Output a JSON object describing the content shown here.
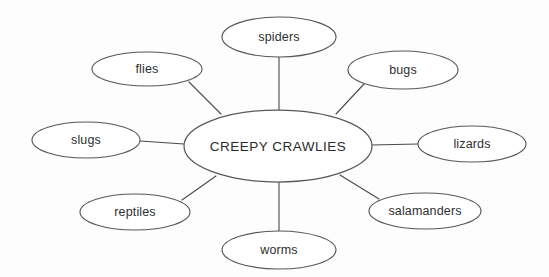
{
  "diagram": {
    "type": "spider-map",
    "background_color": "#fdfdfd",
    "line_color": "#4a4a4a",
    "node_stroke_color": "#55585c",
    "node_fill_color": "#ffffff",
    "text_color": "#2f2f2f",
    "center": {
      "label": "CREEPY CRAWLIES",
      "cx": 278,
      "cy": 146,
      "rx": 94,
      "ry": 36
    },
    "nodes": [
      {
        "id": "spiders",
        "label": "spiders",
        "cx": 279,
        "cy": 37,
        "rx": 57,
        "ry": 20,
        "connector": {
          "x1": 279,
          "y1": 57,
          "x2": 279,
          "y2": 110
        }
      },
      {
        "id": "bugs",
        "label": "bugs",
        "cx": 403,
        "cy": 70,
        "rx": 55,
        "ry": 19,
        "connector": {
          "x1": 364,
          "y1": 84,
          "x2": 336,
          "y2": 114
        }
      },
      {
        "id": "lizards",
        "label": "lizards",
        "cx": 472,
        "cy": 144,
        "rx": 54,
        "ry": 18,
        "connector": {
          "x1": 418,
          "y1": 144,
          "x2": 372,
          "y2": 145
        }
      },
      {
        "id": "salamanders",
        "label": "salamanders",
        "cx": 425,
        "cy": 211,
        "rx": 56,
        "ry": 18,
        "connector": {
          "x1": 379,
          "y1": 199,
          "x2": 340,
          "y2": 175
        }
      },
      {
        "id": "worms",
        "label": "worms",
        "cx": 279,
        "cy": 250,
        "rx": 57,
        "ry": 19,
        "connector": {
          "x1": 279,
          "y1": 231,
          "x2": 279,
          "y2": 182
        }
      },
      {
        "id": "reptiles",
        "label": "reptiles",
        "cx": 135,
        "cy": 212,
        "rx": 55,
        "ry": 18,
        "connector": {
          "x1": 182,
          "y1": 200,
          "x2": 216,
          "y2": 176
        }
      },
      {
        "id": "slugs",
        "label": "slugs",
        "cx": 86,
        "cy": 140,
        "rx": 54,
        "ry": 18,
        "connector": {
          "x1": 140,
          "y1": 141,
          "x2": 184,
          "y2": 144
        }
      },
      {
        "id": "flies",
        "label": "flies",
        "cx": 147,
        "cy": 69,
        "rx": 55,
        "ry": 17,
        "connector": {
          "x1": 189,
          "y1": 82,
          "x2": 221,
          "y2": 114
        }
      }
    ]
  }
}
